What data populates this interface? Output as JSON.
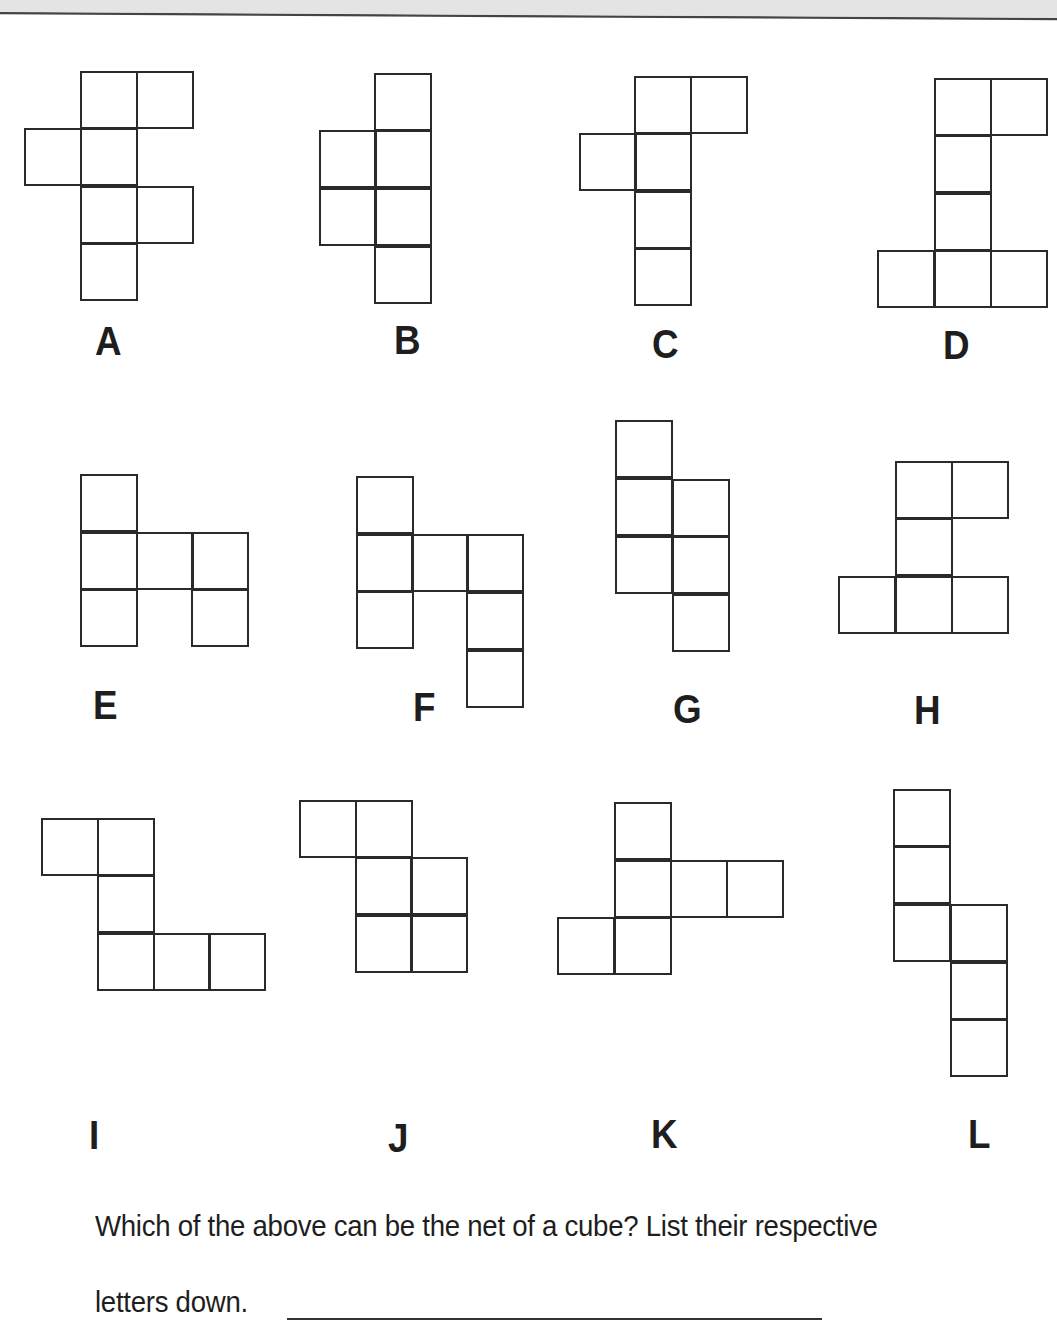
{
  "header": {
    "band_color": "#e4e4e4",
    "rule_color": "#444444"
  },
  "style": {
    "stroke_color": "#2a2a2a",
    "stroke_width": 2,
    "cell_size": 56
  },
  "nets": [
    {
      "label": "A",
      "label_pos": [
        95,
        321
      ],
      "cells": [
        [
          81,
          72
        ],
        [
          137,
          72
        ],
        [
          25,
          129
        ],
        [
          81,
          129
        ],
        [
          81,
          187
        ],
        [
          137,
          187
        ],
        [
          81,
          244
        ]
      ]
    },
    {
      "label": "B",
      "label_pos": [
        394,
        320
      ],
      "cells": [
        [
          375,
          74
        ],
        [
          320,
          131
        ],
        [
          375,
          131
        ],
        [
          320,
          189
        ],
        [
          375,
          189
        ],
        [
          375,
          247
        ]
      ]
    },
    {
      "label": "C",
      "label_pos": [
        652,
        324
      ],
      "cells": [
        [
          635,
          77
        ],
        [
          691,
          77
        ],
        [
          580,
          134
        ],
        [
          635,
          134
        ],
        [
          635,
          192
        ],
        [
          635,
          249
        ]
      ]
    },
    {
      "label": "D",
      "label_pos": [
        943,
        325
      ],
      "cells": [
        [
          935,
          79
        ],
        [
          991,
          79
        ],
        [
          935,
          136
        ],
        [
          935,
          194
        ],
        [
          878,
          251
        ],
        [
          935,
          251
        ],
        [
          991,
          251
        ]
      ]
    },
    {
      "label": "E",
      "label_pos": [
        93,
        685
      ],
      "cells": [
        [
          81,
          475
        ],
        [
          81,
          533
        ],
        [
          137,
          533
        ],
        [
          192,
          533
        ],
        [
          81,
          590
        ],
        [
          192,
          590
        ]
      ]
    },
    {
      "label": "F",
      "label_pos": [
        413,
        687
      ],
      "cells": [
        [
          357,
          477
        ],
        [
          357,
          535
        ],
        [
          412,
          535
        ],
        [
          467,
          535
        ],
        [
          357,
          592
        ],
        [
          467,
          593
        ],
        [
          467,
          651
        ]
      ]
    },
    {
      "label": "G",
      "label_pos": [
        673,
        689
      ],
      "cells": [
        [
          616,
          421
        ],
        [
          616,
          479
        ],
        [
          673,
          480
        ],
        [
          616,
          537
        ],
        [
          673,
          537
        ],
        [
          673,
          595
        ]
      ]
    },
    {
      "label": "H",
      "label_pos": [
        914,
        690
      ],
      "cells": [
        [
          896,
          462
        ],
        [
          952,
          462
        ],
        [
          896,
          519
        ],
        [
          839,
          577
        ],
        [
          896,
          577
        ],
        [
          952,
          577
        ]
      ]
    },
    {
      "label": "I",
      "label_pos": [
        89,
        1115
      ],
      "cells": [
        [
          42,
          819
        ],
        [
          98,
          819
        ],
        [
          98,
          876
        ],
        [
          98,
          934
        ],
        [
          154,
          934
        ],
        [
          209,
          934
        ]
      ]
    },
    {
      "label": "J",
      "label_pos": [
        388,
        1118
      ],
      "cells": [
        [
          300,
          801
        ],
        [
          356,
          801
        ],
        [
          356,
          858
        ],
        [
          411,
          858
        ],
        [
          356,
          916
        ],
        [
          411,
          916
        ]
      ]
    },
    {
      "label": "K",
      "label_pos": [
        651,
        1114
      ],
      "cells": [
        [
          615,
          803
        ],
        [
          615,
          861
        ],
        [
          671,
          861
        ],
        [
          727,
          861
        ],
        [
          558,
          918
        ],
        [
          615,
          918
        ]
      ]
    },
    {
      "label": "L",
      "label_pos": [
        968,
        1114
      ],
      "cells": [
        [
          894,
          790
        ],
        [
          894,
          847
        ],
        [
          894,
          905
        ],
        [
          951,
          905
        ],
        [
          951,
          963
        ],
        [
          951,
          1020
        ]
      ]
    }
  ],
  "question": {
    "line1": "Which of the above can be the net of a cube? List their respective",
    "line2": "letters down.",
    "answer_value": ""
  }
}
